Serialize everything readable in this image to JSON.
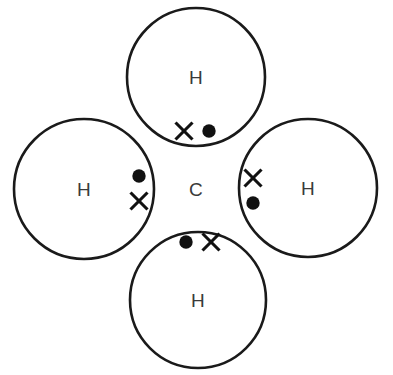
{
  "diagram": {
    "molecule": "CH4",
    "background_color": "#ffffff",
    "line_color": "#1a1a1a",
    "label_color": "#3a3a3a",
    "electron_color": "#111111",
    "central_atom": {
      "label": "C",
      "name": "carbon",
      "x": 196,
      "y": 189
    },
    "outer_atoms": [
      {
        "label": "H",
        "name": "hydrogen-top",
        "cx": 196,
        "cy": 77,
        "r": 69,
        "label_x": 196,
        "label_y": 77
      },
      {
        "label": "H",
        "name": "hydrogen-left",
        "cx": 84,
        "cy": 189,
        "r": 70,
        "label_x": 84,
        "label_y": 189
      },
      {
        "label": "H",
        "name": "hydrogen-right",
        "cx": 308,
        "cy": 188,
        "r": 69,
        "label_x": 308,
        "label_y": 188
      },
      {
        "label": "H",
        "name": "hydrogen-bottom",
        "cx": 198,
        "cy": 300,
        "r": 68,
        "label_x": 198,
        "label_y": 300
      }
    ],
    "bonds": [
      {
        "name": "bond-top",
        "orientation": "horizontal",
        "electrons": [
          {
            "type": "cross",
            "symbol": "X",
            "x": 184,
            "y": 131,
            "belongs_to": "hydrogen"
          },
          {
            "type": "dot",
            "symbol": "●",
            "x": 209,
            "y": 131,
            "belongs_to": "carbon"
          }
        ]
      },
      {
        "name": "bond-left",
        "orientation": "vertical",
        "electrons": [
          {
            "type": "dot",
            "symbol": "●",
            "x": 139,
            "y": 176,
            "belongs_to": "carbon"
          },
          {
            "type": "cross",
            "symbol": "X",
            "x": 139,
            "y": 201,
            "belongs_to": "hydrogen"
          }
        ]
      },
      {
        "name": "bond-right",
        "orientation": "vertical",
        "electrons": [
          {
            "type": "cross",
            "symbol": "X",
            "x": 253,
            "y": 178,
            "belongs_to": "hydrogen"
          },
          {
            "type": "dot",
            "symbol": "●",
            "x": 253,
            "y": 203,
            "belongs_to": "carbon"
          }
        ]
      },
      {
        "name": "bond-bottom",
        "orientation": "horizontal",
        "electrons": [
          {
            "type": "dot",
            "symbol": "●",
            "x": 186,
            "y": 242,
            "belongs_to": "carbon"
          },
          {
            "type": "cross",
            "symbol": "X",
            "x": 211,
            "y": 242,
            "belongs_to": "hydrogen"
          }
        ]
      }
    ],
    "electron_dot_radius": 6.7,
    "electron_cross_half": 8.5
  }
}
